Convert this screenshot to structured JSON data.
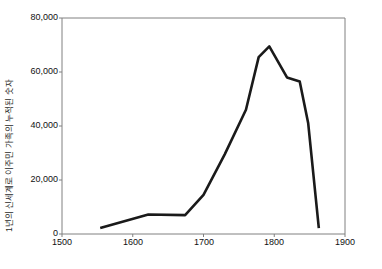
{
  "chart_data": {
    "type": "line",
    "title": "",
    "xlabel": "",
    "ylabel": "1년의 신세계로 이주민 가족의 누적된 숫자",
    "xlim": [
      1500,
      1900
    ],
    "ylim": [
      0,
      80000
    ],
    "xticks": [
      "1500",
      "1600",
      "1700",
      "1800",
      "1900"
    ],
    "xtick_values": [
      1500,
      1600,
      1700,
      1800,
      1900
    ],
    "yticks": [
      "0",
      "20,000",
      "40,000",
      "60,000",
      "80,000"
    ],
    "ytick_values": [
      0,
      20000,
      40000,
      60000,
      80000
    ],
    "grid": false,
    "legend": false,
    "series": [
      {
        "name": "누적 이주민 가족 수",
        "color": "#1a1a1a",
        "line_width": 2.6,
        "x": [
          1554,
          1622,
          1674,
          1700,
          1730,
          1760,
          1778,
          1793,
          1818,
          1836,
          1848,
          1863
        ],
        "values": [
          2200,
          7200,
          7000,
          14500,
          29500,
          46000,
          65500,
          69500,
          58000,
          56500,
          41000,
          2200
        ]
      }
    ]
  },
  "axis": {
    "y_axis_name": "y-axis",
    "x_axis_name": "x-axis"
  }
}
